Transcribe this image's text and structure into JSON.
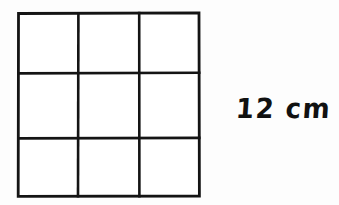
{
  "figure": {
    "type": "square-grid-diagram",
    "background_color": "#fdfdfd",
    "line_color": "#141414",
    "grid": {
      "name": "3x3-square-grid",
      "rows": 3,
      "columns": 3,
      "cell_count": 9,
      "fill_color": "#ffffff",
      "cells": [
        {
          "row": 1,
          "column": 1,
          "label": ""
        },
        {
          "row": 1,
          "column": 2,
          "label": ""
        },
        {
          "row": 1,
          "column": 3,
          "label": ""
        },
        {
          "row": 2,
          "column": 1,
          "label": ""
        },
        {
          "row": 2,
          "column": 2,
          "label": ""
        },
        {
          "row": 2,
          "column": 3,
          "label": ""
        },
        {
          "row": 3,
          "column": 1,
          "label": ""
        },
        {
          "row": 3,
          "column": 2,
          "label": ""
        },
        {
          "row": 3,
          "column": 3,
          "label": ""
        }
      ]
    },
    "annotations": [
      {
        "name": "side-length-label",
        "value": "12",
        "unit": "cm",
        "text": "12 cm",
        "color": "#111111"
      }
    ]
  }
}
